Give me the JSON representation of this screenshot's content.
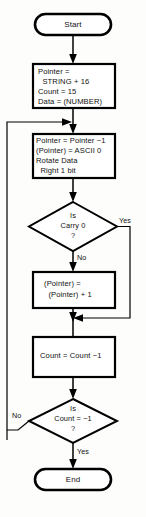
{
  "diagram": {
    "colors": {
      "background": "#fdfdfc",
      "stroke": "#000000",
      "fill": "#ffffff",
      "text": "#111111"
    },
    "nodes": {
      "start": {
        "type": "terminator",
        "label": "Start"
      },
      "init": {
        "type": "process",
        "lines": [
          "Pointer =",
          "  STRING + 16",
          "Count = 15",
          "Data = (NUMBER)"
        ]
      },
      "loop_body": {
        "type": "process",
        "lines": [
          "Pointer = Pointer −1",
          "(Pointer) = ASCII 0",
          "Rotate Data",
          "  Right 1 bit"
        ]
      },
      "carry_test": {
        "type": "decision",
        "lines": [
          "Is",
          "Carry 0",
          "?"
        ]
      },
      "increment": {
        "type": "process",
        "lines": [
          "(Pointer) =",
          "  (Pointer) + 1"
        ]
      },
      "decrement": {
        "type": "process",
        "lines": [
          "Count = Count −1"
        ]
      },
      "count_test": {
        "type": "decision",
        "lines": [
          "Is",
          "Count = −1",
          "?"
        ]
      },
      "end": {
        "type": "terminator",
        "label": "End"
      }
    },
    "branch_labels": {
      "carry_yes": "Yes",
      "carry_no": "No",
      "count_no": "No",
      "count_yes": "Yes"
    }
  }
}
